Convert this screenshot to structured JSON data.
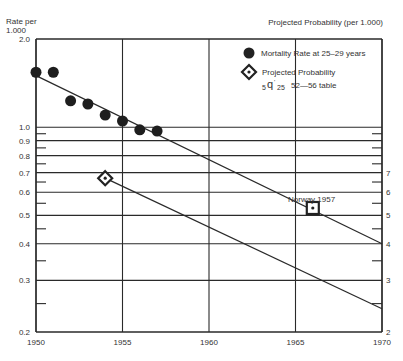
{
  "header": {
    "left_axis_title_line1": "Rate per",
    "left_axis_title_line2": "1.000",
    "right_axis_title": "Projected Probability (per 1.000)"
  },
  "legend": {
    "mortality_label": "Mortality Rate at 25–29 years",
    "projected_label": "Projected Probability",
    "projected_sub_prefix": "5",
    "projected_sub_q": "q",
    "projected_sub_suffix": "25",
    "projected_sub_table": "52—56 table"
  },
  "annotation": {
    "norway": "Norway 1957"
  },
  "chart_data": {
    "type": "scatter",
    "title": "",
    "xlabel": "",
    "ylabel": "Rate per 1.000",
    "ylabel_right": "Projected Probability (per 1.000)",
    "yscale": "log",
    "xlim": [
      1950,
      1970
    ],
    "ylim": [
      0.2,
      2.0
    ],
    "x_ticks": [
      "1950",
      "1955",
      "1960",
      "1965",
      "1970"
    ],
    "y_ticks_left": [
      "2.0",
      "1.0",
      "0.9",
      "0.8",
      "0.7",
      "0.6",
      "0.5",
      "0.4",
      "0.3",
      "0.2"
    ],
    "y_ticks_right": [
      "7",
      "6",
      "5",
      "4",
      "3",
      "2"
    ],
    "grid": true,
    "legend_position": "upper right",
    "series": [
      {
        "name": "Mortality Rate at 25–29 years",
        "marker": "filled-circle",
        "x": [
          1950,
          1951,
          1952,
          1953,
          1954,
          1955,
          1956,
          1957
        ],
        "y": [
          1.54,
          1.54,
          1.23,
          1.2,
          1.1,
          1.05,
          0.98,
          0.97
        ]
      },
      {
        "name": "Projected Probability 5q'25 52—56 table",
        "marker": "diamond",
        "x": [
          1954
        ],
        "y": [
          0.67
        ]
      },
      {
        "name": "Norway 1957",
        "marker": "square-dot",
        "x": [
          1966
        ],
        "y": [
          0.53
        ]
      },
      {
        "name": "Mortality trend line",
        "type": "line",
        "x": [
          1950,
          1970
        ],
        "y": [
          1.5,
          0.4
        ]
      },
      {
        "name": "Projected trend line",
        "type": "line",
        "x": [
          1954,
          1970
        ],
        "y": [
          0.67,
          0.24
        ]
      }
    ]
  }
}
